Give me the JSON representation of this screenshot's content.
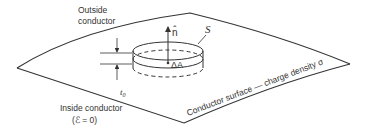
{
  "figure": {
    "type": "gaussian-pillbox-diagram",
    "colors": {
      "stroke": "#333333",
      "background": "#ffffff"
    }
  },
  "labels": {
    "outside_line1": "Outside",
    "outside_line2": "conductor",
    "inside_line1": "Inside conductor",
    "inside_line2": "(ℰ = 0)",
    "surface": "Conductor surface — charge density σ",
    "normal": "n̂",
    "surface_s": "S",
    "area": "ΔA",
    "thickness": "t",
    "thickness_sub": "0"
  }
}
